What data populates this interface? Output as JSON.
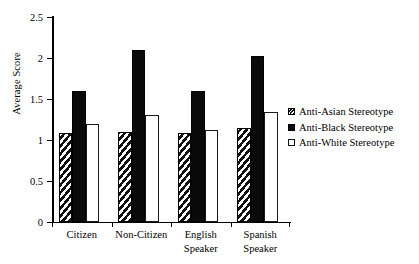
{
  "chart_data": {
    "type": "bar",
    "title": "",
    "xlabel": "",
    "ylabel": "Average Score",
    "ylim": [
      0,
      2.5
    ],
    "yticks": [
      "0",
      "0.5",
      "1",
      "1.5",
      "2",
      "2.5"
    ],
    "ytick_values": [
      0,
      0.5,
      1,
      1.5,
      2,
      2.5
    ],
    "grid": false,
    "legend_position": "right",
    "categories": [
      "Citizen",
      "Non-Citizen",
      "English Speaker",
      "Spanish Speaker"
    ],
    "category_lines": [
      [
        "Citizen"
      ],
      [
        "Non-Citizen"
      ],
      [
        "English",
        "Speaker"
      ],
      [
        "Spanish",
        "Speaker"
      ]
    ],
    "series": [
      {
        "name": "Anti-Asian Stereotype",
        "fill": "hatched",
        "values": [
          1.08,
          1.1,
          1.08,
          1.15
        ]
      },
      {
        "name": "Anti-Black Stereotype",
        "fill": "solid",
        "values": [
          1.6,
          2.1,
          1.6,
          2.02
        ]
      },
      {
        "name": "Anti-White Stereotype",
        "fill": "open",
        "values": [
          1.2,
          1.3,
          1.12,
          1.34
        ]
      }
    ]
  },
  "legend": {
    "items": [
      {
        "label": "Anti-Asian Stereotype",
        "fill": "hatched"
      },
      {
        "label": "Anti-Black Stereotype",
        "fill": "solid"
      },
      {
        "label": "Anti-White Stereotype",
        "fill": "open"
      }
    ]
  },
  "colors": {
    "axis": "#000000",
    "solid_bar": "#0a0a0a",
    "open_bar": "#ffffff",
    "background": "#ffffff"
  }
}
